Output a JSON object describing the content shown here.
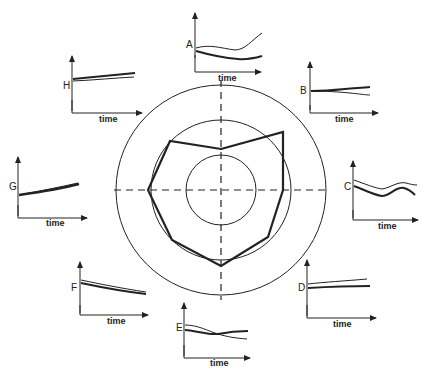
{
  "diagram": {
    "type": "radar-with-time-series",
    "center": [
      221,
      190
    ],
    "rings": [
      {
        "name": "inner",
        "r": 35
      },
      {
        "name": "middle",
        "r": 70
      },
      {
        "name": "outer",
        "r": 105
      }
    ],
    "axes": [
      "vertical-dashed",
      "horizontal-dashed"
    ],
    "polygon_vertices": [
      {
        "label": "A",
        "x": 221,
        "y": 149
      },
      {
        "label": "B",
        "x": 283,
        "y": 132
      },
      {
        "label": "C",
        "x": 283,
        "y": 190
      },
      {
        "label": "D",
        "x": 268,
        "y": 237
      },
      {
        "label": "E",
        "x": 221,
        "y": 266
      },
      {
        "label": "F",
        "x": 172,
        "y": 240
      },
      {
        "label": "G",
        "x": 148,
        "y": 190
      },
      {
        "label": "H",
        "x": 170,
        "y": 141
      }
    ],
    "colors": {
      "ink": "#222222",
      "background": "#ffffff"
    }
  },
  "plots": [
    {
      "id": "A",
      "label": "A",
      "x_label": "time"
    },
    {
      "id": "B",
      "label": "B",
      "x_label": "time"
    },
    {
      "id": "C",
      "label": "C",
      "x_label": "time"
    },
    {
      "id": "D",
      "label": "D",
      "x_label": "time"
    },
    {
      "id": "E",
      "label": "E",
      "x_label": "time"
    },
    {
      "id": "F",
      "label": "F",
      "x_label": "time"
    },
    {
      "id": "G",
      "label": "G",
      "x_label": "time"
    },
    {
      "id": "H",
      "label": "H",
      "x_label": "time"
    }
  ]
}
